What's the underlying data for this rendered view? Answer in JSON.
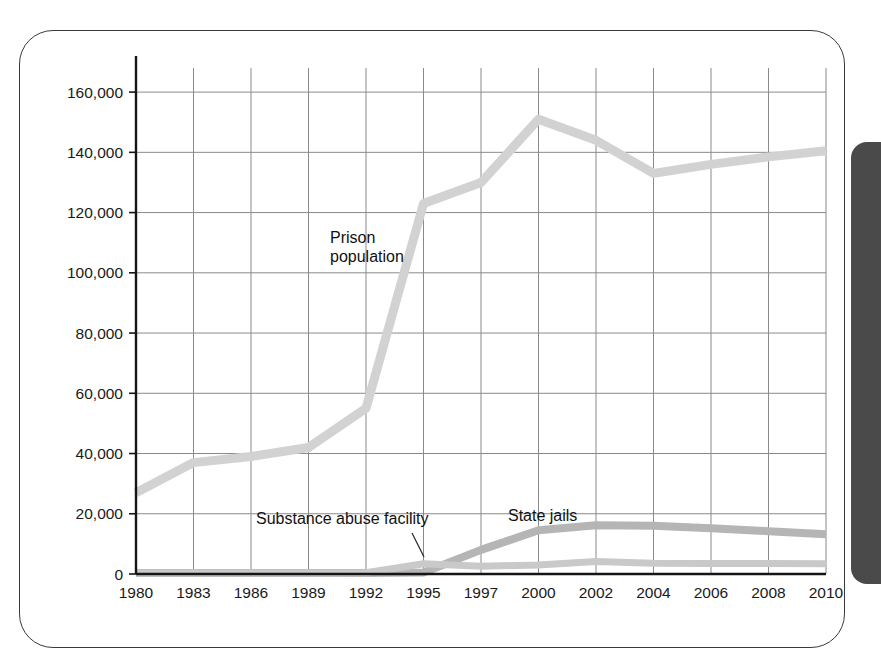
{
  "figure": {
    "frame_label": "chart-frame",
    "edge_band_color": "#4a4a4a"
  },
  "chart_data": {
    "type": "line",
    "title": "",
    "subtitle": "",
    "xlabel": "",
    "ylabel": "",
    "grid": true,
    "legend_position": "inline-annotations",
    "categories": [
      "1980",
      "1983",
      "1986",
      "1989",
      "1992",
      "1995",
      "1997",
      "2000",
      "2002",
      "2004",
      "2006",
      "2008",
      "2010"
    ],
    "x": [
      1980,
      1983,
      1986,
      1989,
      1992,
      1995,
      1997,
      2000,
      2002,
      2004,
      2006,
      2008,
      2010
    ],
    "xlim": [
      1980,
      2010
    ],
    "ylim": [
      0,
      168000
    ],
    "yticks": [
      0,
      20000,
      40000,
      60000,
      80000,
      100000,
      120000,
      140000,
      160000
    ],
    "ytick_labels": [
      "0",
      "20,000",
      "40,000",
      "60,000",
      "80,000",
      "100,000",
      "120,000",
      "140,000",
      "160,000"
    ],
    "series": [
      {
        "name": "Prison population",
        "color": "#d2d2d2",
        "values": [
          27000,
          37000,
          39000,
          42000,
          55000,
          123000,
          130000,
          151000,
          144000,
          133000,
          136000,
          138500,
          140500
        ]
      },
      {
        "name": "State jails",
        "color": "#b5b5b5",
        "values": [
          300,
          300,
          300,
          300,
          300,
          500,
          8000,
          14500,
          16200,
          16000,
          15200,
          14200,
          13200
        ]
      },
      {
        "name": "Substance abuse facility",
        "color": "#c9c9c9",
        "values": [
          300,
          300,
          300,
          300,
          400,
          3400,
          2600,
          3000,
          4200,
          3600,
          3500,
          3500,
          3400
        ]
      }
    ],
    "annotations": [
      {
        "text": "Prison population",
        "target_series": "Prison population"
      },
      {
        "text": "Substance abuse facility",
        "target_series": "Substance abuse facility"
      },
      {
        "text": "State jails",
        "target_series": "State jails"
      }
    ]
  }
}
